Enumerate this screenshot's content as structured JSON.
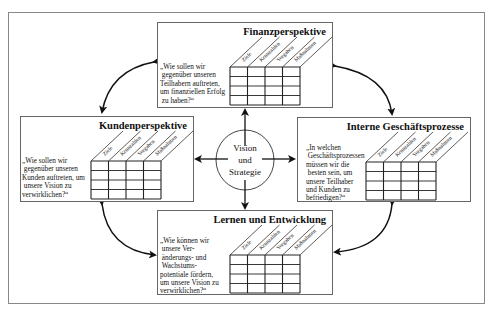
{
  "diagram": {
    "center": {
      "lines": [
        "Vision",
        "und",
        "Strategie"
      ]
    },
    "column_headers": [
      "Ziele",
      "Kennzahlen",
      "Vorgaben",
      "Maßnahmen"
    ],
    "perspectives": {
      "finanz": {
        "title": "Finanzperspektive",
        "question": "„Wie sollen wir\n gegenüber unseren\nTeilhabern auftreten,\num finanziellen Erfolg\n zu haben?“"
      },
      "kunden": {
        "title": "Kundenperspektive",
        "question": "„Wie sollen wir\n gegenüber unseren\nKunden auftreten, um\n unsere Vision zu\nverwirklichen?“"
      },
      "interne": {
        "title": "Interne Geschäftsprozesse",
        "question": "„In welchen\n Geschäftsprozessen\nmüssen wir die\n besten sein, um\nunsere Teilhaber\nund Kunden zu\nbefriedigen?“"
      },
      "lernen": {
        "title": "Lernen und Entwicklung",
        "question": "„Wie können wir\n unsere Ver-\n änderungs- und\n Wachstums-\npotentiale fördern,\num unsere Vision zu\nverwirklichen?“"
      }
    },
    "colors": {
      "line": "#222222",
      "border": "#666666",
      "frame": "#888888"
    }
  }
}
